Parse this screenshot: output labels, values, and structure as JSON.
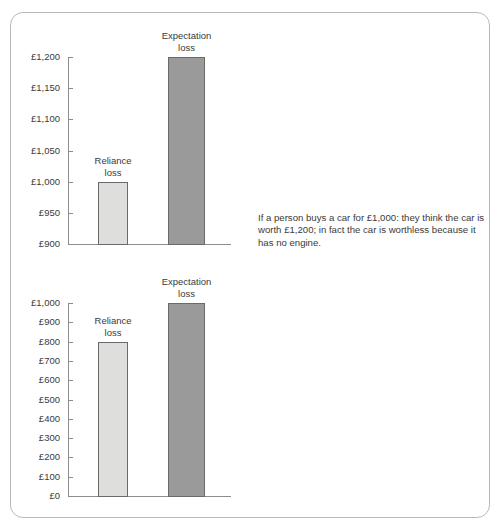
{
  "figure": {
    "frame_color": "#b9b9b9",
    "background": "#ffffff"
  },
  "panels": [
    {
      "id": "top",
      "caption": "If a person buys a car for £1,000: they think the car is worth £1,200; in fact the car is worthless because it has no engine."
    },
    {
      "id": "bottom",
      "caption": "If a person buys a car for £1,000: they know the car should only be worth £800; in fact the car is worthless because it has no engine."
    }
  ],
  "chart_data": [
    {
      "type": "bar",
      "id": "top-chart",
      "title": "",
      "xlabel": "",
      "ylabel": "",
      "categories": [
        "Reliance loss",
        "Expectation loss"
      ],
      "values": [
        1000,
        1200
      ],
      "bar_labels": [
        {
          "line1": "Reliance",
          "line2": "loss"
        },
        {
          "line1": "Expectation",
          "line2": "loss"
        }
      ],
      "bar_colors": [
        "#dededd",
        "#9a9a9a"
      ],
      "ylim": [
        900,
        1200
      ],
      "ytick_values": [
        1200,
        1150,
        1100,
        1050,
        1000,
        950,
        900
      ],
      "ytick_labels": [
        "£1,200",
        "£1,150",
        "£1,100",
        "£1,050",
        "£1,000",
        "£950",
        "£900"
      ],
      "grid": false,
      "legend": "none"
    },
    {
      "type": "bar",
      "id": "bottom-chart",
      "title": "",
      "xlabel": "",
      "ylabel": "",
      "categories": [
        "Reliance loss",
        "Expectation loss"
      ],
      "values": [
        800,
        1000
      ],
      "bar_labels": [
        {
          "line1": "Reliance",
          "line2": "loss"
        },
        {
          "line1": "Expectation",
          "line2": "loss"
        }
      ],
      "bar_colors": [
        "#dededd",
        "#9a9a9a"
      ],
      "ylim": [
        0,
        1000
      ],
      "ytick_values": [
        1000,
        900,
        800,
        700,
        600,
        500,
        400,
        300,
        200,
        100,
        0
      ],
      "ytick_labels": [
        "£1,000",
        "£900",
        "£800",
        "£700",
        "£600",
        "£500",
        "£400",
        "£300",
        "£200",
        "£100",
        "£0"
      ],
      "grid": false,
      "legend": "none"
    }
  ]
}
